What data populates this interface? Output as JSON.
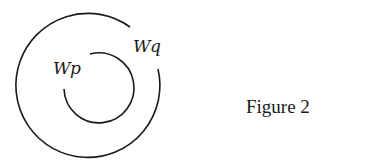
{
  "figure": {
    "caption": "Figure 2",
    "labels": {
      "inner": "Wp",
      "outer": "Wq"
    },
    "stroke_color": "#1a1a1a"
  }
}
